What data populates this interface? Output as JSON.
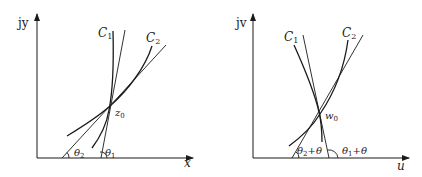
{
  "left_panel": {
    "y_axis_label": "jy",
    "x_axis_label": "x",
    "curve1_label": "C",
    "curve1_sub": "1",
    "curve2_label": "C",
    "curve2_sub": "2",
    "point_label": "z",
    "point_sub": "0",
    "angle2_label": "θ",
    "angle2_sub": "2",
    "angle1_label": "θ",
    "angle1_sub": "1"
  },
  "right_panel": {
    "y_axis_label": "jv",
    "x_axis_label": "u",
    "curve1_label": "C",
    "curve1_sub": "1",
    "curve2_label": "C",
    "curve2_sub": "2",
    "point_label": "w",
    "point_sub": "0",
    "angle2_label": "θ",
    "angle2_sub": "2",
    "angle2_suffix": "+θ",
    "angle1_label": "θ",
    "angle1_sub": "1",
    "angle1_suffix": "+θ"
  },
  "colors": {
    "stroke": "#1a1a1a",
    "background": "#ffffff"
  }
}
